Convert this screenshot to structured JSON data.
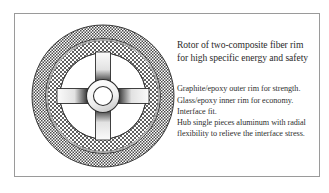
{
  "figure": {
    "background_color": "#ffffff",
    "frame_color": "#9a9a9a",
    "ink_color": "#2a2a2a"
  },
  "caption": {
    "title_lines": [
      "Rotor of two-composite fiber rim",
      "for high specific energy and safety"
    ],
    "detail_lines": [
      "Graphite/epoxy outer rim for strength.",
      "Glass/epoxy inner rim for economy.",
      "Interface fit.",
      "Hub single pieces aluminum with radial",
      "flexibility to relieve the interface stress."
    ]
  },
  "diagram": {
    "name": "flywheel-rotor-cross-section",
    "parts": [
      {
        "id": "outer-rim",
        "label": "Graphite/epoxy outer rim",
        "texture": "stipple"
      },
      {
        "id": "inner-rim",
        "label": "Glass/epoxy inner rim",
        "texture": "crosshatch"
      },
      {
        "id": "spokes",
        "label": "Hub spokes",
        "count": 4
      },
      {
        "id": "hub",
        "label": "Aluminum hub ring"
      },
      {
        "id": "bore",
        "label": "Central bore"
      }
    ]
  }
}
